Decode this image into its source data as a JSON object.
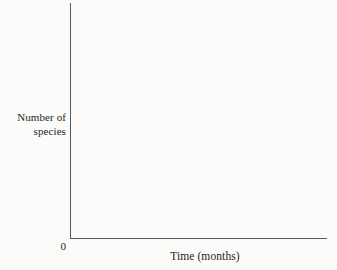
{
  "figure": {
    "background_color": "#fbfbfa",
    "axis_color": "#5a5a5a",
    "text_color": "#1d1d1d"
  },
  "chart_data": {
    "type": "line",
    "title": "",
    "subtitle": "",
    "xlabel": "Time (months)",
    "ylabel": "Number of species",
    "ylabel_lines": [
      "Number of",
      "species"
    ],
    "origin_label": "0",
    "x_tick_labels": [],
    "y_tick_labels": [],
    "xlim": [
      0,
      null
    ],
    "ylim": [
      0,
      null
    ],
    "grid": false,
    "legend": false,
    "legend_position": "none",
    "series": [],
    "x": [],
    "values": [],
    "annotations": [],
    "note": "Blank axes only; no data points, ticks, gridlines, or curves are drawn."
  }
}
